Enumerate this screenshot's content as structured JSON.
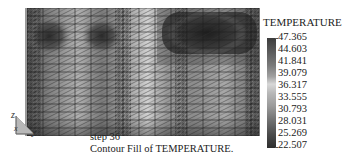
{
  "legend": {
    "title": "TEMPERATURE",
    "ticks": [
      "47.365",
      "44.603",
      "41.841",
      "39.079",
      "36.317",
      "33.555",
      "30.793",
      "28.031",
      "25.269",
      "22.507"
    ],
    "max": 47.365,
    "min": 22.507,
    "colormap": "grayscale (dark high, light mid, dark low)"
  },
  "caption": {
    "step": "step 36",
    "description": "Contour Fill of TEMPERATURE."
  },
  "triad": {
    "vertical_axis": "z",
    "horizontal_axis": "y",
    "depth_axis": "x"
  },
  "plot": {
    "type": "finite element mesh contour fill",
    "mesh": "triangulated rectangular grid",
    "features": [
      "dark hot zones at upper-left (two circular regions)",
      "large dark band at upper-right",
      "light vertical bands at center",
      "refined mesh columns at left, center, right edges"
    ]
  }
}
